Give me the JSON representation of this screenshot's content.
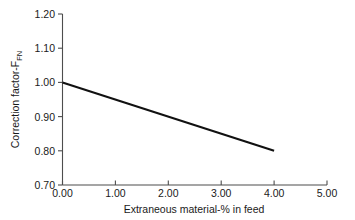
{
  "chart_data": {
    "type": "line",
    "title": "",
    "subtitle": "",
    "xlabel": "Extraneous material-% in feed",
    "ylabel_main": "Correction factor-F",
    "ylabel_sub": "FN",
    "ylabel_full": "Correction factor-F_FN",
    "x": [
      0.0,
      4.0
    ],
    "values": [
      1.0,
      0.8
    ],
    "series": [
      {
        "name": "Correction factor",
        "x": [
          0.0,
          4.0
        ],
        "values": [
          1.0,
          0.8
        ],
        "color": "#111111"
      }
    ],
    "xlim": [
      0.0,
      5.0
    ],
    "ylim": [
      0.7,
      1.2
    ],
    "xticks": [
      0.0,
      1.0,
      2.0,
      3.0,
      4.0,
      5.0
    ],
    "yticks": [
      0.7,
      0.8,
      0.9,
      1.0,
      1.1,
      1.2
    ],
    "xtick_labels": [
      "0.00",
      "1.00",
      "2.00",
      "3.00",
      "4.00",
      "5.00"
    ],
    "ytick_labels": [
      "0.70",
      "0.80",
      "0.90",
      "1.00",
      "1.10",
      "1.20"
    ],
    "grid": false,
    "legend": false,
    "legend_position": "none",
    "annotations": [],
    "slope": -0.05,
    "intercept": 1.0,
    "background_color": "#ffffff",
    "axis_color": "#4d4d4d",
    "line_color": "#111111"
  },
  "axes": {
    "x_tick_direction": "in",
    "y_tick_direction": "out",
    "spines": [
      "left",
      "bottom"
    ]
  }
}
